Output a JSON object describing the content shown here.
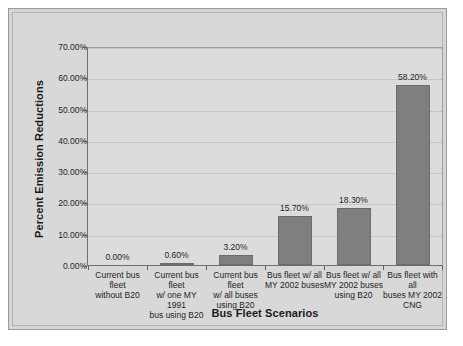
{
  "chart_data": {
    "type": "bar",
    "title": "",
    "xlabel": "Bus Fleet Scenarios",
    "ylabel": "Percent Emission Reductions",
    "categories": [
      "Current bus fleet without B20",
      "Current bus fleet w/ one MY 1991 bus using B20",
      "Current bus fleet w/ all buses using B20",
      "Bus fleet w/ all MY 2002 buses",
      "Bus fleet w/ all MY 2002 buses using B20",
      "Bus fleet with all buses MY 2002 CNG"
    ],
    "category_lines": [
      [
        "Current bus fleet",
        "without B20"
      ],
      [
        "Current bus fleet",
        "w/ one MY 1991",
        "bus using B20"
      ],
      [
        "Current bus fleet",
        "w/ all buses",
        "using B20"
      ],
      [
        "Bus fleet w/ all",
        "MY 2002 buses"
      ],
      [
        "Bus fleet w/ all",
        "MY 2002 buses",
        "using B20"
      ],
      [
        "Bus fleet with all",
        "buses MY 2002",
        "CNG"
      ]
    ],
    "values": [
      0.0,
      0.6,
      3.2,
      15.7,
      18.3,
      58.2
    ],
    "value_labels": [
      "0.00%",
      "0.60%",
      "3.20%",
      "15.70%",
      "18.30%",
      "58.20%"
    ],
    "ylim": [
      0,
      70
    ],
    "ytick_values": [
      0,
      10,
      20,
      30,
      40,
      50,
      60,
      70
    ],
    "ytick_labels": [
      "0.00%",
      "10.00%",
      "20.00%",
      "30.00%",
      "40.00%",
      "50.00%",
      "60.00%",
      "70.00%"
    ],
    "grid": true,
    "legend": false,
    "bar_color": "#7f7f7f",
    "plot_background": "#dcdcdc",
    "figure_background": "#d8d8d8"
  }
}
